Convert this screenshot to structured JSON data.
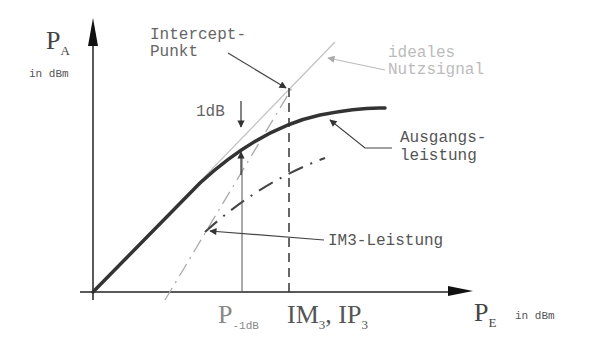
{
  "diagram": {
    "y_axis": {
      "symbol": "P",
      "subscript": "A",
      "unit": "in dBm"
    },
    "x_axis": {
      "symbol": "P",
      "subscript": "E",
      "unit": "in dBm"
    },
    "labels": {
      "intercept_line1": "Intercept-",
      "intercept_line2": "Punkt",
      "ideal_line1": "ideales",
      "ideal_line2": "Nutzsignal",
      "output_line1": "Ausgangs-",
      "output_line2": "leistung",
      "im3": "IM3-Leistung",
      "one_db": "1dB"
    },
    "x_ticks": {
      "p1db_symbol": "P",
      "p1db_sub": "-1dB",
      "im3_symbol": "IM",
      "im3_sub": "3",
      "sep": ",",
      "ip3_symbol": "IP",
      "ip3_sub": "3"
    },
    "colors": {
      "axis": "#222222",
      "output_curve": "#333333",
      "ideal_line": "#c0c0c0",
      "im3_curve": "#555555",
      "light_text": "#bbbbbb"
    }
  }
}
